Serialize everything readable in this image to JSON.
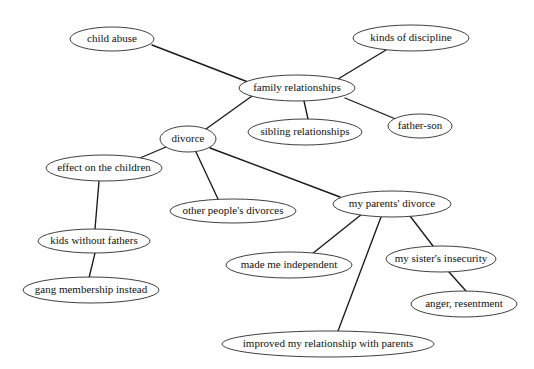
{
  "diagram": {
    "type": "concept-map",
    "background_color": "#ffffff",
    "node_fill": "#ffffff",
    "node_stroke": "#2a2a2a",
    "edge_color": "#1a1a1a",
    "text_color": "#111111",
    "width": 534,
    "height": 369,
    "nodes": [
      {
        "id": "child_abuse",
        "label": "child abuse",
        "cx": 112,
        "cy": 39,
        "rx": 42,
        "ry": 12
      },
      {
        "id": "kinds_discipline",
        "label": "kinds of discipline",
        "cx": 411,
        "cy": 38,
        "rx": 58,
        "ry": 13
      },
      {
        "id": "family_rel",
        "label": "family relationships",
        "cx": 297,
        "cy": 88,
        "rx": 58,
        "ry": 13
      },
      {
        "id": "father_son",
        "label": "father-son",
        "cx": 420,
        "cy": 126,
        "rx": 32,
        "ry": 12
      },
      {
        "id": "sibling_rel",
        "label": "sibling relationships",
        "cx": 305,
        "cy": 132,
        "rx": 57,
        "ry": 13
      },
      {
        "id": "divorce",
        "label": "divorce",
        "cx": 188,
        "cy": 139,
        "rx": 28,
        "ry": 13
      },
      {
        "id": "effect_children",
        "label": "effect on the children",
        "cx": 104,
        "cy": 168,
        "rx": 58,
        "ry": 13
      },
      {
        "id": "other_divorces",
        "label": "other people's divorces",
        "cx": 233,
        "cy": 211,
        "rx": 63,
        "ry": 12
      },
      {
        "id": "my_parents_divorce",
        "label": "my parents' divorce",
        "cx": 392,
        "cy": 204,
        "rx": 59,
        "ry": 13
      },
      {
        "id": "kids_no_fathers",
        "label": "kids without fathers",
        "cx": 94,
        "cy": 241,
        "rx": 56,
        "ry": 12
      },
      {
        "id": "made_independent",
        "label": "made me independent",
        "cx": 289,
        "cy": 265,
        "rx": 63,
        "ry": 13
      },
      {
        "id": "sister_insecurity",
        "label": "my sister's insecurity",
        "cx": 441,
        "cy": 259,
        "rx": 55,
        "ry": 13
      },
      {
        "id": "gang_membership",
        "label": "gang membership instead",
        "cx": 91,
        "cy": 290,
        "rx": 68,
        "ry": 13
      },
      {
        "id": "anger_resentment",
        "label": "anger, resentment",
        "cx": 464,
        "cy": 304,
        "rx": 53,
        "ry": 13
      },
      {
        "id": "improved_rel",
        "label": "improved my relationship with parents",
        "cx": 328,
        "cy": 344,
        "rx": 106,
        "ry": 13
      }
    ],
    "edges": [
      {
        "from": "child_abuse",
        "to": "family_rel",
        "x1": 152,
        "y1": 45,
        "x2": 248,
        "y2": 82
      },
      {
        "from": "kinds_discipline",
        "to": "family_rel",
        "x1": 386,
        "y1": 50,
        "x2": 338,
        "y2": 79
      },
      {
        "from": "family_rel",
        "to": "father_son",
        "x1": 345,
        "y1": 98,
        "x2": 398,
        "y2": 120
      },
      {
        "from": "family_rel",
        "to": "sibling_rel",
        "x1": 304,
        "y1": 101,
        "x2": 308,
        "y2": 119
      },
      {
        "from": "family_rel",
        "to": "divorce",
        "x1": 252,
        "y1": 96,
        "x2": 206,
        "y2": 129
      },
      {
        "from": "divorce",
        "to": "effect_children",
        "x1": 166,
        "y1": 147,
        "x2": 140,
        "y2": 158
      },
      {
        "from": "divorce",
        "to": "other_divorces",
        "x1": 196,
        "y1": 152,
        "x2": 218,
        "y2": 199
      },
      {
        "from": "divorce",
        "to": "my_parents_divorce",
        "x1": 210,
        "y1": 148,
        "x2": 340,
        "y2": 197
      },
      {
        "from": "effect_children",
        "to": "kids_no_fathers",
        "x1": 99,
        "y1": 181,
        "x2": 95,
        "y2": 229
      },
      {
        "from": "kids_no_fathers",
        "to": "gang_membership",
        "x1": 95,
        "y1": 253,
        "x2": 89,
        "y2": 278
      },
      {
        "from": "my_parents_divorce",
        "to": "made_independent",
        "x1": 362,
        "y1": 214,
        "x2": 312,
        "y2": 254
      },
      {
        "from": "my_parents_divorce",
        "to": "sister_insecurity",
        "x1": 410,
        "y1": 216,
        "x2": 433,
        "y2": 246
      },
      {
        "from": "my_parents_divorce",
        "to": "improved_rel",
        "x1": 381,
        "y1": 217,
        "x2": 338,
        "y2": 331
      },
      {
        "from": "sister_insecurity",
        "to": "anger_resentment",
        "x1": 449,
        "y1": 272,
        "x2": 466,
        "y2": 291
      }
    ]
  }
}
